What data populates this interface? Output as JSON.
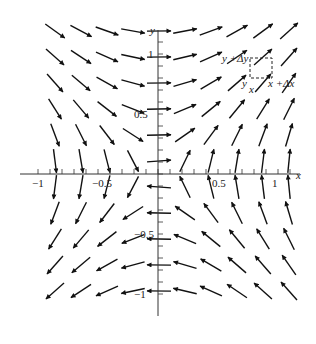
{
  "chart_data": {
    "type": "vector_field",
    "title": "",
    "field": {
      "fx": "y",
      "fy": "x"
    },
    "xlabel": "x",
    "ylabel": "y",
    "xlim": [
      -1.1,
      1.2
    ],
    "ylim": [
      -1.1,
      1.2
    ],
    "x_ticks": [
      {
        "value": -1,
        "label": "−1"
      },
      {
        "value": -0.5,
        "label": "−0.5"
      },
      {
        "value": 0.5,
        "label": "0.5"
      },
      {
        "value": 1,
        "label": "1"
      }
    ],
    "y_ticks": [
      {
        "value": 1,
        "label": "1"
      },
      {
        "value": 0.5,
        "label": "0.5"
      },
      {
        "value": -0.5,
        "label": "−0.5"
      },
      {
        "value": -1,
        "label": "−1"
      }
    ],
    "grid_spacing": 0.2167,
    "annotations": {
      "box_top_label": "y +Δy",
      "box_bottom_left_y": "y",
      "box_bottom_left_x": "x",
      "box_right_label": "x +Δx"
    }
  }
}
